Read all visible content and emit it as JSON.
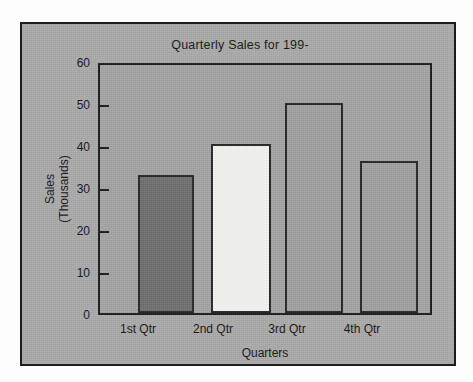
{
  "figure": {
    "card_background": "#a9a9a9",
    "card_border": "#1c1c1c",
    "plot_background": "#a3a3a3",
    "axis_color": "#1b1b1b"
  },
  "chart_data": {
    "type": "bar",
    "title": "Quarterly Sales for 199-",
    "xlabel": "Quarters",
    "ylabel": "Sales\n(Thousands)",
    "ylabel_line1": "Sales",
    "ylabel_line2": "(Thousands)",
    "categories": [
      "1st Qtr",
      "2nd Qtr",
      "3rd Qtr",
      "4th Qtr"
    ],
    "values": [
      33.5,
      41.0,
      50.8,
      36.8
    ],
    "bar_colors": [
      "#6f6f6f",
      "#f2f2f0",
      "#a0a0a0",
      "#a0a0a0"
    ],
    "bar_border_color": "#262626",
    "ylim": [
      0,
      60
    ],
    "yticks": [
      0,
      10,
      20,
      30,
      40,
      50,
      60
    ],
    "ytick_labels": [
      "0",
      "10",
      "20",
      "30",
      "40",
      "50",
      "60"
    ],
    "grid": false,
    "legend": false,
    "legend_position": "none"
  }
}
